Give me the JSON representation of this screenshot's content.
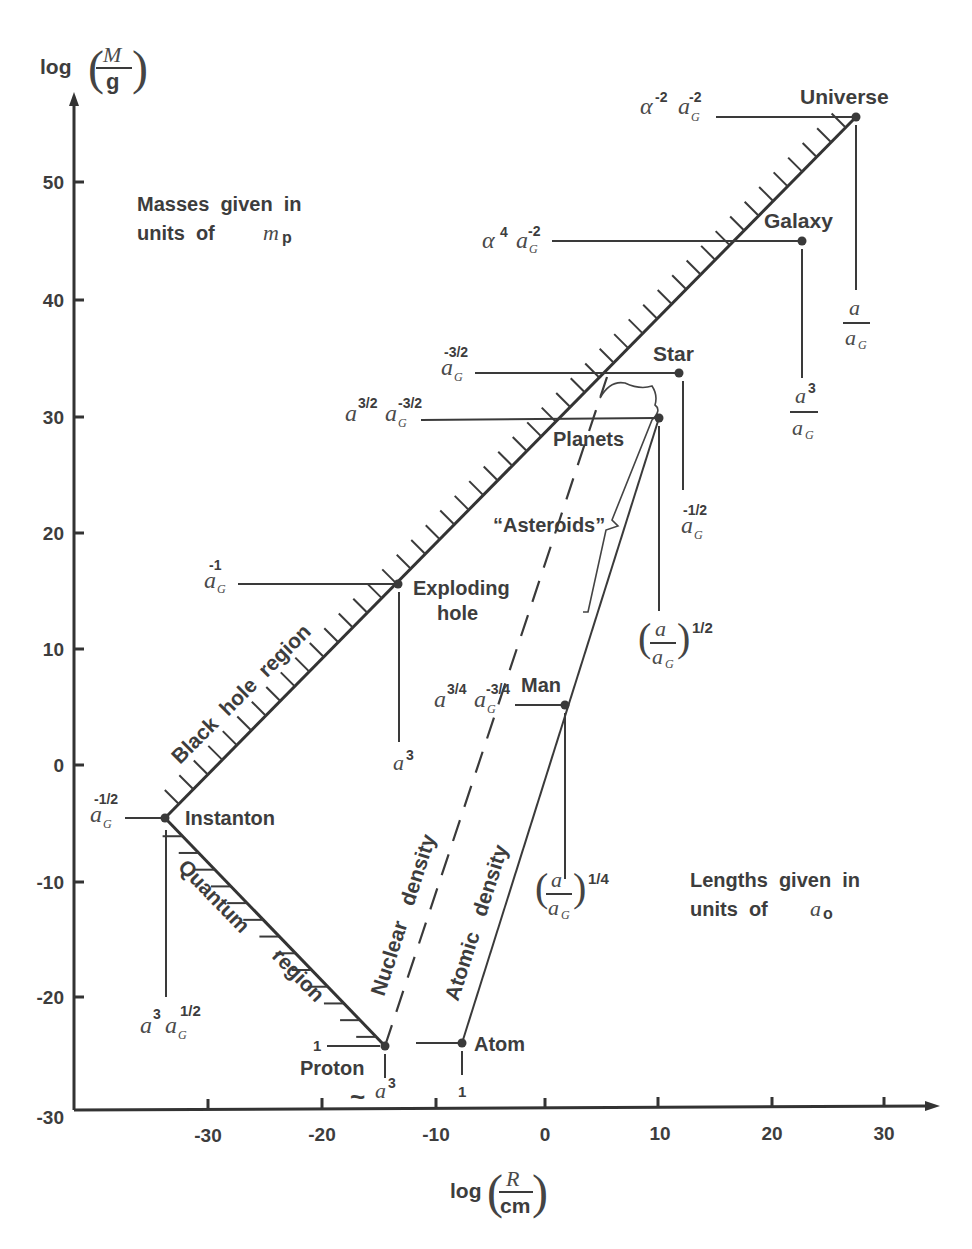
{
  "chart_data": {
    "type": "scatter",
    "title": "",
    "xlabel": "log (R / cm)",
    "ylabel": "log (M / g)",
    "xlim": [
      -40,
      35
    ],
    "ylim": [
      -30,
      58
    ],
    "x_ticks": [
      -30,
      -20,
      -10,
      0,
      10,
      20,
      30
    ],
    "y_ticks": [
      -30,
      -20,
      -10,
      0,
      10,
      20,
      30,
      40,
      50
    ],
    "grid": false,
    "points": [
      {
        "name": "Universe",
        "x": 27.4,
        "y": 55.6,
        "mass_label": "α^-2 a_G^-2",
        "length_label": "a / a_G"
      },
      {
        "name": "Galaxy",
        "x": 22.6,
        "y": 45.0,
        "mass_label": "α^4 a_G^-2",
        "length_label": "a^3 / a_G"
      },
      {
        "name": "Star",
        "x": 11.8,
        "y": 33.7,
        "mass_label": "a_G^-3/2",
        "length_label": "a_G^-1/2"
      },
      {
        "name": "Planets",
        "x": 10.1,
        "y": 29.8,
        "mass_label": "a^3/2 a_G^-3/2",
        "length_label": "(a / a_G)^1/2"
      },
      {
        "name": "Man",
        "x": 1.8,
        "y": 5.1,
        "mass_label": "a^3/4 a_G^-3/4",
        "length_label": "(a / a_G)^1/4"
      },
      {
        "name": "Exploding hole",
        "x": -13.0,
        "y": 15.5,
        "mass_label": "a_G^-1",
        "length_label": "a^3"
      },
      {
        "name": "Instanton",
        "x": -33.5,
        "y": -4.5,
        "mass_label": "a_G^-1/2",
        "length_label": "a^3 a_G^1/2"
      },
      {
        "name": "Proton",
        "x": -14.1,
        "y": -24.1,
        "mass_label": "1",
        "length_label": "~ a^3"
      },
      {
        "name": "Atom",
        "x": -7.3,
        "y": -23.9,
        "mass_label": "1",
        "length_label": "1"
      }
    ],
    "lines": [
      {
        "name": "Black hole region",
        "style": "solid-hatched",
        "from": [
          -33.5,
          -4.5
        ],
        "to": [
          27.4,
          55.6
        ]
      },
      {
        "name": "Quantum region",
        "style": "solid-hatched",
        "from": [
          -33.5,
          -4.5
        ],
        "to": [
          -14.1,
          -24.1
        ]
      },
      {
        "name": "Nuclear density",
        "style": "dashed",
        "from": [
          -14.1,
          -24.1
        ],
        "to": [
          5.5,
          33.5
        ]
      },
      {
        "name": "Atomic density",
        "style": "solid",
        "from": [
          -7.3,
          -23.9
        ],
        "to": [
          10.1,
          29.8
        ]
      }
    ],
    "annotations": [
      "Masses given in units of m_p",
      "Lengths given in units of a_o",
      "\"Asteroids\""
    ]
  },
  "axes": {
    "y_label_log": "log",
    "y_label_num": "M",
    "y_label_den": "g",
    "x_label_log": "log",
    "x_label_num": "R",
    "x_label_den": "cm",
    "y_ticks": [
      "50",
      "40",
      "30",
      "20",
      "10",
      "0",
      "-10",
      "-20",
      "-30"
    ],
    "x_ticks": [
      "-30",
      "-20",
      "-10",
      "0",
      "10",
      "20",
      "30"
    ]
  },
  "notes": {
    "masses_line1": "Masses  given  in",
    "masses_line2": "units  of",
    "masses_sym": "m",
    "masses_sub": "p",
    "lengths_line1": "Lengths  given  in",
    "lengths_line2": "units  of",
    "lengths_sym": "a",
    "lengths_sub": "o"
  },
  "objects": {
    "universe": "Universe",
    "galaxy": "Galaxy",
    "star": "Star",
    "planets": "Planets",
    "asteroids": "“Asteroids”",
    "exploding1": "Exploding",
    "exploding2": "hole",
    "man": "Man",
    "instanton": "Instanton",
    "proton": "Proton",
    "atom": "Atom"
  },
  "regions": {
    "black_hole": "Black  hole  region",
    "quantum": "Quantum",
    "quantum_region": "region",
    "nuclear": "Nuclear   density",
    "atomic": "Atomic   density"
  },
  "scaling": {
    "universe_mass_a": "α",
    "universe_mass_a_exp": "-2",
    "universe_mass_g": "a",
    "universe_mass_g_exp": "-2",
    "galaxy_mass_a": "α",
    "galaxy_mass_a_exp": "4",
    "galaxy_mass_g_exp": "-2",
    "star_mass_exp": "-3/2",
    "planets_mass_a_exp": "3/2",
    "planets_mass_g_exp": "-3/2",
    "exploding_mass_exp": "-1",
    "man_mass_a_exp": "3/4",
    "man_mass_g_exp": "-3/4",
    "instanton_mass_exp": "-1/2",
    "proton_mass": "1",
    "atom_mass": "1",
    "a": "a",
    "G": "G",
    "exp3": "3",
    "half": "1/2",
    "quarter": "1/4",
    "star_len_exp": "-1/2",
    "tilde": "~",
    "atom_len": "1"
  }
}
